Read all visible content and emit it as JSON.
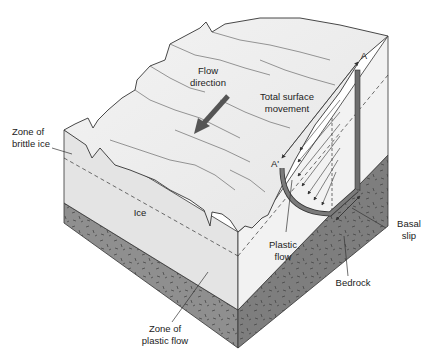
{
  "diagram": {
    "labels": {
      "flow_direction_line1": "Flow",
      "flow_direction_line2": "direction",
      "total_surface_line1": "Total surface",
      "total_surface_line2": "movement",
      "brittle_line1": "Zone of",
      "brittle_line2": "brittle ice",
      "ice": "Ice",
      "plastic_zone_line1": "Zone of",
      "plastic_zone_line2": "plastic flow",
      "plastic_flow_line1": "Plastic",
      "plastic_flow_line2": "flow",
      "basal_line1": "Basal",
      "basal_line2": "slip",
      "bedrock": "Bedrock",
      "point_a": "A",
      "point_a_prime": "A'"
    },
    "colors": {
      "ice_top": "#eeeeee",
      "ice_face_left": "#e4e4e4",
      "ice_face_right": "#f2f2f2",
      "bedrock_left": "#8f8f8f",
      "bedrock_right": "#7e7e7e",
      "profile_bar": "#6e6e6e",
      "line": "#333333",
      "text": "#222222"
    }
  }
}
